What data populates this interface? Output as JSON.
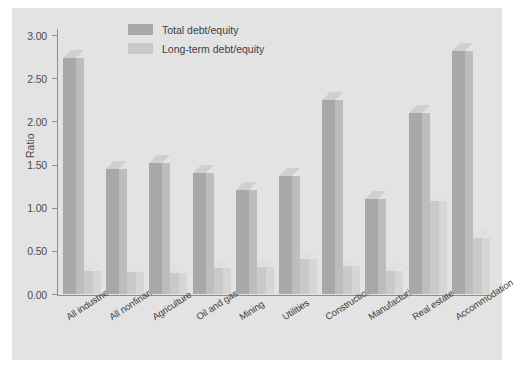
{
  "chart_data": {
    "type": "bar",
    "title": "",
    "subtitle": "",
    "xlabel": "",
    "ylabel": "Ratio",
    "ylim": [
      0.0,
      3.0
    ],
    "ytick_labels": [
      "0.00",
      "0.50",
      "1.00",
      "1.50",
      "2.00",
      "2.50",
      "3.00"
    ],
    "ytick_values": [
      0.0,
      0.5,
      1.0,
      1.5,
      2.0,
      2.5,
      3.0
    ],
    "grid": false,
    "legend_position": "top-center",
    "style": "3d-bar",
    "categories": [
      "All industries",
      "All nonfinancial",
      "Agriculture",
      "Oil and gas",
      "Mining",
      "Utilities",
      "Construction",
      "Manufacturing",
      "Real estate",
      "Accommodation"
    ],
    "series": [
      {
        "name": "Total debt/equity",
        "color": "#a8a8a8",
        "values": [
          2.73,
          1.45,
          1.52,
          1.4,
          1.2,
          1.37,
          2.25,
          1.1,
          2.1,
          2.82
        ]
      },
      {
        "name": "Long-term debt/equity",
        "color": "#c9c9c9",
        "values": [
          0.27,
          0.25,
          0.24,
          0.3,
          0.31,
          0.41,
          0.33,
          0.27,
          1.08,
          0.65
        ]
      }
    ]
  },
  "legend": {
    "items": [
      {
        "label": "Total debt/equity",
        "color": "#a8a8a8"
      },
      {
        "label": "Long-term debt/equity",
        "color": "#c9c9c9"
      }
    ]
  },
  "axis": {
    "y_title": "Ratio"
  },
  "caption": {
    "text": ""
  }
}
